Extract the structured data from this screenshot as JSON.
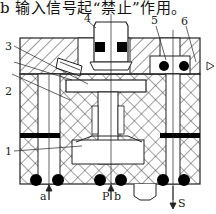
{
  "caption": "b 输入信号起“禁止”作用。",
  "diagram": {
    "type": "pneumatic valve cross-section",
    "part_labels": [
      {
        "id": "1",
        "text": "1"
      },
      {
        "id": "2",
        "text": "2"
      },
      {
        "id": "3",
        "text": "3"
      },
      {
        "id": "4",
        "text": "4"
      },
      {
        "id": "5",
        "text": "5"
      },
      {
        "id": "6",
        "text": "6"
      }
    ],
    "port_labels": {
      "a": "a",
      "P": "P",
      "b": "b",
      "S": "S"
    },
    "colors": {
      "line": "#222222",
      "seal": "#000000",
      "background": "#ffffff"
    }
  }
}
